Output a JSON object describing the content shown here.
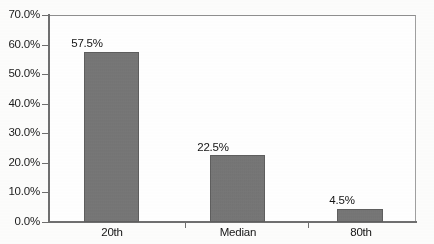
{
  "chart_data": {
    "type": "bar",
    "title": "",
    "subtitle": "",
    "xlabel": "",
    "ylabel": "",
    "categories": [
      "20th",
      "Median",
      "80th"
    ],
    "values": [
      57.5,
      22.5,
      4.5
    ],
    "value_labels": [
      "57.5%",
      "22.5%",
      "4.5%"
    ],
    "ylim": [
      0,
      70
    ],
    "ytick_values": [
      0,
      10,
      20,
      30,
      40,
      50,
      60,
      70
    ],
    "ytick_labels": [
      "0.0%",
      "10.0%",
      "20.0%",
      "30.0%",
      "40.0%",
      "50.0%",
      "60.0%",
      "70.0%"
    ],
    "grid": false,
    "legend": false,
    "legend_position": "none",
    "series": [
      {
        "name": "",
        "values": [
          57.5,
          22.5,
          4.5
        ],
        "color": "#757575"
      }
    ],
    "colors": {
      "bar_fill": "#757575",
      "bar_outline": "#5e5e5e",
      "axis": "#6f6f6f",
      "frame": "#8a8a8a",
      "text": "#151515",
      "background": "#ffffff"
    }
  }
}
